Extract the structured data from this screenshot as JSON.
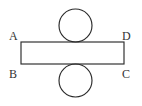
{
  "figure": {
    "kind": "geometry-diagram",
    "canvas": {
      "width": 142,
      "height": 106,
      "background": "#ffffff"
    },
    "stroke_color": "#2b2b2b",
    "label_color": "#333333",
    "rectangle": {
      "name": "ABCD",
      "x": 21,
      "y": 42,
      "width": 103,
      "height": 22
    },
    "circles": [
      {
        "name": "top-circle",
        "cx": 75.5,
        "cy": 25.5,
        "r": 16.5,
        "tangent_to": "rectangle-top-edge"
      },
      {
        "name": "bottom-circle",
        "cx": 75.5,
        "cy": 80.5,
        "r": 16.5,
        "tangent_to": "rectangle-bottom-edge"
      }
    ],
    "labels": [
      {
        "id": "A",
        "text": "A",
        "x": 9,
        "y": 40,
        "corner": "top-left"
      },
      {
        "id": "D",
        "text": "D",
        "x": 122,
        "y": 40,
        "corner": "top-right"
      },
      {
        "id": "B",
        "text": "B",
        "x": 9,
        "y": 78,
        "corner": "bottom-left"
      },
      {
        "id": "C",
        "text": "C",
        "x": 122,
        "y": 78,
        "corner": "bottom-right"
      }
    ]
  }
}
